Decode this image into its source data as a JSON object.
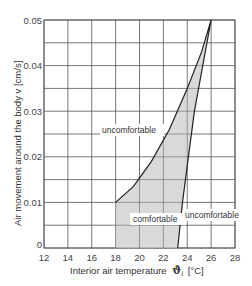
{
  "chart_data": {
    "type": "area",
    "title": "",
    "xlabel": "Interior air temperature ϑi [°C]",
    "ylabel": "Air movement around the body v [cm/s]",
    "xlim": [
      12,
      28
    ],
    "ylim": [
      0,
      0.05
    ],
    "x_ticks": [
      "12",
      "14",
      "16",
      "18",
      "20",
      "22",
      "24",
      "26",
      "28"
    ],
    "y_ticks": [
      "0",
      "0.01",
      "0.02",
      "0.03",
      "0.04",
      "0.05"
    ],
    "grid": true,
    "legend": null,
    "series": [
      {
        "name": "comfortable zone",
        "fill": "#d9d9d9",
        "boundary": [
          {
            "x": 18.0,
            "y": 0.0
          },
          {
            "x": 18.0,
            "y": 0.01
          },
          {
            "x": 19.5,
            "y": 0.0135
          },
          {
            "x": 21.0,
            "y": 0.019
          },
          {
            "x": 22.5,
            "y": 0.026
          },
          {
            "x": 24.0,
            "y": 0.035
          },
          {
            "x": 25.2,
            "y": 0.043
          },
          {
            "x": 26.0,
            "y": 0.05
          },
          {
            "x": 24.6,
            "y": 0.03
          },
          {
            "x": 23.6,
            "y": 0.01
          },
          {
            "x": 23.2,
            "y": 0.0
          }
        ]
      }
    ],
    "annotations": [
      {
        "text": "uncomfortable",
        "x": 20.5,
        "y": 0.0305
      },
      {
        "text": "comfortable",
        "x": 22.0,
        "y": 0.0125
      },
      {
        "text": "uncomfortable",
        "x": 26.0,
        "y": 0.0075
      }
    ]
  },
  "labels": {
    "x_axis": "Interior air temperature",
    "x_symbol": "ϑ",
    "x_subscript": "i",
    "x_unit": "[°C]",
    "y_axis": "Air movement around the body  v [cm/s]",
    "ann_upper": "uncomfortable",
    "ann_mid": "comfortable",
    "ann_right": "uncomfortable"
  }
}
